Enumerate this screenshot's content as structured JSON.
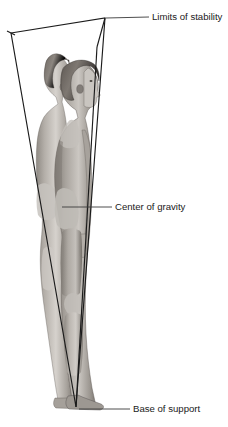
{
  "figure": {
    "background_color": "#ffffff",
    "line_color": "#1b1b1b",
    "text_color": "#1a1a1a",
    "width": 228,
    "height": 427
  },
  "annotations": {
    "limits_of_stability": {
      "label": "Limits of stability",
      "text_x": 152,
      "text_y": 17,
      "leader_from_x": 106,
      "leader_from_y": 18,
      "leader_to_x": 149,
      "leader_to_y": 17
    },
    "center_of_gravity": {
      "label": "Center of gravity",
      "text_x": 115,
      "text_y": 207,
      "leader_from_x": 62,
      "leader_from_y": 207,
      "leader_to_x": 112,
      "leader_to_y": 207
    },
    "base_of_support": {
      "label": "Base of support",
      "text_x": 133,
      "text_y": 409,
      "leader_from_x": 79,
      "leader_from_y": 409,
      "leader_to_x": 130,
      "leader_to_y": 409
    }
  },
  "cone": {
    "name": "limits-of-stability-cone",
    "apex_x": 76,
    "apex_y": 407,
    "top_left_x": 11,
    "top_left_y": 33,
    "top_right_x": 105,
    "top_right_y": 18,
    "inner_right_top_x": 97,
    "inner_right_top_y": 47
  },
  "subjects": [
    {
      "name": "rear-figure",
      "description": "Standing nude male adolescent shown in left profile, positioned behind",
      "skin_tone": "#b9b4ae",
      "hair_tone": "#6b6560"
    },
    {
      "name": "front-figure",
      "description": "Standing nude male adolescent shown in left profile, positioned in front",
      "skin_tone": "#a39e98",
      "hair_tone": "#55504b"
    }
  ],
  "palette": {
    "skin_light": "#d8d4cf",
    "skin_mid": "#b0aba5",
    "skin_shadow": "#8a857f",
    "skin_deep": "#6d6862",
    "hair_light": "#8e8881",
    "hair_dark": "#4a443f",
    "outline": "#1b1b1b"
  }
}
